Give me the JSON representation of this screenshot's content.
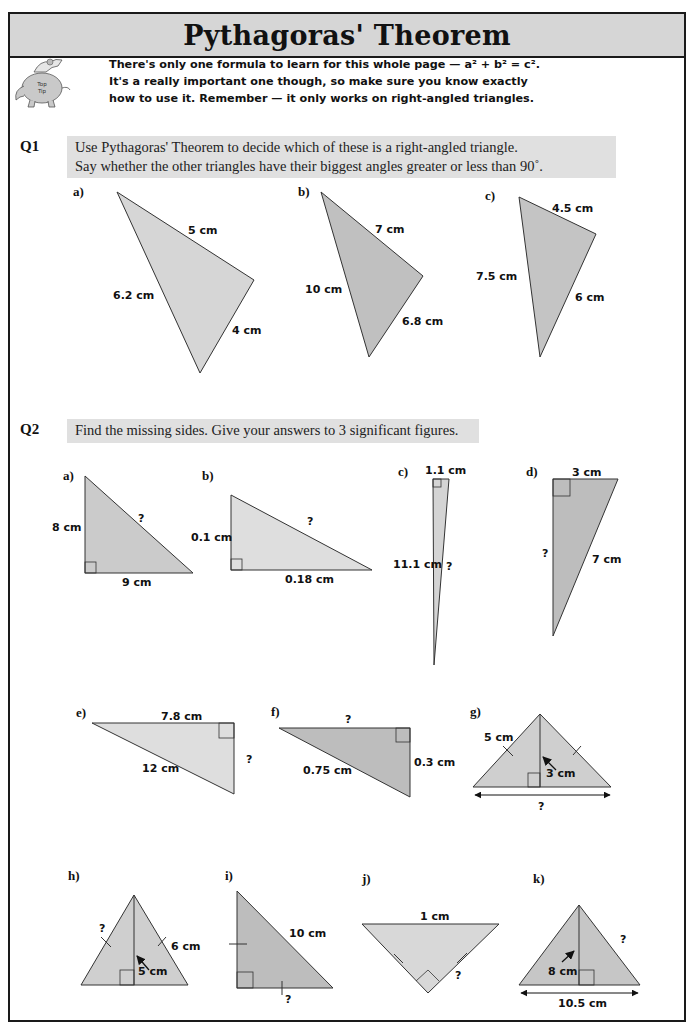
{
  "title": "Pythagoras' Theorem",
  "top_tip": {
    "icon": "elephant-top-tip-icon",
    "icon_text": [
      "Top",
      "Tip"
    ],
    "lines": [
      "There's only one formula to learn for this whole page — a² + b² = c².",
      "It's a really important one though, so make sure you know exactly",
      "how to use it.  Remember — it only works on right-angled triangles."
    ]
  },
  "q1": {
    "label": "Q1",
    "instructions": [
      "Use Pythagoras' Theorem to decide which of these is a right-angled triangle.",
      "Say whether the other triangles have their biggest angles greater or less than 90˚."
    ],
    "triangles": [
      {
        "part": "a)",
        "sides": [
          "5 cm",
          "6.2 cm",
          "4 cm"
        ],
        "fill": "#d6d6d6"
      },
      {
        "part": "b)",
        "sides": [
          "7 cm",
          "10 cm",
          "6.8 cm"
        ],
        "fill": "#c0c0c0"
      },
      {
        "part": "c)",
        "sides": [
          "4.5 cm",
          "7.5 cm",
          "6 cm"
        ],
        "fill": "#c4c4c4"
      }
    ]
  },
  "q2": {
    "label": "Q2",
    "instructions": "Find the missing sides.  Give your answers to 3 significant figures.",
    "triangles": [
      {
        "part": "a)",
        "labels": [
          "8 cm",
          "9 cm",
          "?"
        ],
        "fill": "#cbcbcb"
      },
      {
        "part": "b)",
        "labels": [
          "0.1 cm",
          "0.18 cm",
          "?"
        ],
        "fill": "#dedede"
      },
      {
        "part": "c)",
        "labels": [
          "1.1 cm",
          "11.1 cm",
          "?"
        ],
        "fill": "#d4d4d4"
      },
      {
        "part": "d)",
        "labels": [
          "3 cm",
          "?",
          "7 cm"
        ],
        "fill": "#bdbdbd"
      },
      {
        "part": "e)",
        "labels": [
          "7.8 cm",
          "12 cm",
          "?"
        ],
        "fill": "#dedede"
      },
      {
        "part": "f)",
        "labels": [
          "?",
          "0.75 cm",
          "0.3 cm"
        ],
        "fill": "#bdbdbd"
      },
      {
        "part": "g)",
        "labels": [
          "5 cm",
          "3 cm",
          "?"
        ],
        "fill": "#cfcfcf"
      },
      {
        "part": "h)",
        "labels": [
          "?",
          "6 cm",
          "5 cm"
        ],
        "fill": "#cfcfcf"
      },
      {
        "part": "i)",
        "labels": [
          "10 cm",
          "?"
        ],
        "fill": "#bdbdbd"
      },
      {
        "part": "j)",
        "labels": [
          "1 cm",
          "?"
        ],
        "fill": "#d8d8d8"
      },
      {
        "part": "k)",
        "labels": [
          "?",
          "8 cm",
          "10.5 cm"
        ],
        "fill": "#c6c6c6"
      }
    ]
  }
}
